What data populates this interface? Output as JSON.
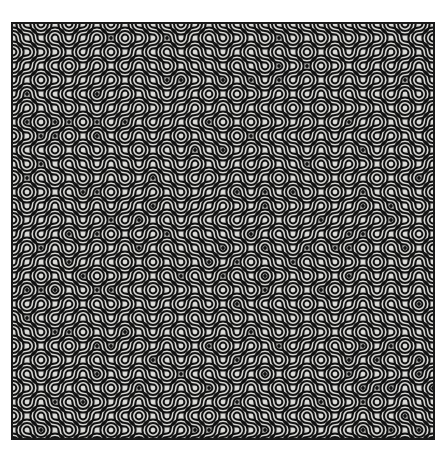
{
  "artwork": {
    "title": "Multi-scale Truchet Arc Tiling",
    "type": "generative-pattern",
    "canvas_width": 447,
    "canvas_height": 460,
    "page_background": "#ffffff"
  },
  "pattern": {
    "name": "truchet-arc-tiling",
    "x": 11,
    "y": 22,
    "width": 424,
    "height": 418,
    "background_color": "#d9d9d6",
    "line_color": "#111111",
    "border_color": "#1a1a1a",
    "border_width": 2,
    "tile_size": 14.0,
    "columns": 31,
    "rows": 30,
    "stroke_width": 2.0,
    "stroke_gap": 1.6,
    "bundle_lines": 3,
    "dot_radius": 1.9,
    "random_seed": 20240517,
    "tile_variants": [
      "arc-ne-sw",
      "arc-nw-se"
    ],
    "orientation_bias": 0.5
  },
  "chart_data": {
    "type": "heatmap",
    "xlabel": "",
    "ylabel": "",
    "legend": [],
    "grid": false,
    "columns": 31,
    "rows": 30,
    "values": []
  }
}
